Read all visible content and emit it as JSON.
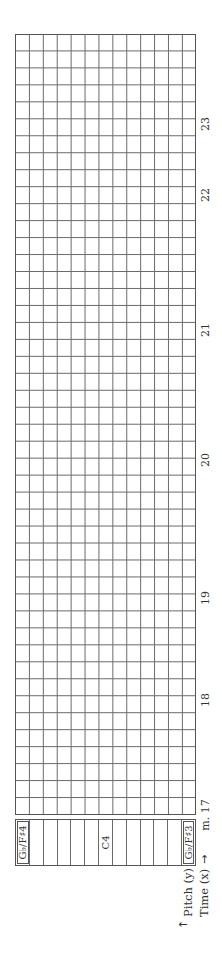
{
  "diagram": {
    "type": "pitch-time grid worksheet",
    "orientation": "rotated 90° counter-clockwise",
    "grid": {
      "time_columns": 46,
      "pitch_rows": 13,
      "line_color": "#6a6a6a",
      "border_color": "#555555"
    },
    "pitch_labels": [
      {
        "row": 0,
        "label": "G♭/F♯4",
        "boxed": true
      },
      {
        "row": 1,
        "label": ""
      },
      {
        "row": 2,
        "label": ""
      },
      {
        "row": 3,
        "label": ""
      },
      {
        "row": 4,
        "label": ""
      },
      {
        "row": 5,
        "label": ""
      },
      {
        "row": 6,
        "label": "C4"
      },
      {
        "row": 7,
        "label": ""
      },
      {
        "row": 8,
        "label": ""
      },
      {
        "row": 9,
        "label": ""
      },
      {
        "row": 10,
        "label": ""
      },
      {
        "row": 11,
        "label": ""
      },
      {
        "row": 12,
        "label": "G♭/F♯3",
        "boxed": true
      }
    ],
    "measures": [
      {
        "label": "m. 17",
        "x": 142
      },
      {
        "label": "18",
        "x": 257
      },
      {
        "label": "19",
        "x": 359
      },
      {
        "label": "20",
        "x": 497
      },
      {
        "label": "21",
        "x": 627
      },
      {
        "label": "22",
        "x": 762
      },
      {
        "label": "23",
        "x": 833
      }
    ],
    "axis": {
      "pitch_label": "Pitch (y)",
      "time_label": "Time (x)",
      "pitch_arrow": "↑",
      "time_arrow": "→"
    }
  }
}
